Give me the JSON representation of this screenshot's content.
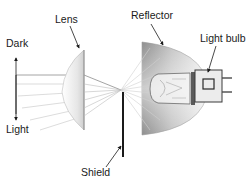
{
  "diagram": {
    "labels": {
      "dark": "Dark",
      "light": "Light",
      "lens": "Lens",
      "reflector": "Reflector",
      "light_bulb": "Light bulb",
      "shield": "Shield"
    },
    "colors": {
      "background": "#ffffff",
      "text": "#1a1a1a",
      "ray": "#b8b8b8",
      "shield": "#1a1a1a",
      "reflector_dark": "#8e8e8e",
      "reflector_light": "#f2f2f2",
      "lens_shade": "#d6d6d6"
    },
    "components": [
      "Lens",
      "Reflector",
      "Light bulb",
      "Shield"
    ]
  }
}
